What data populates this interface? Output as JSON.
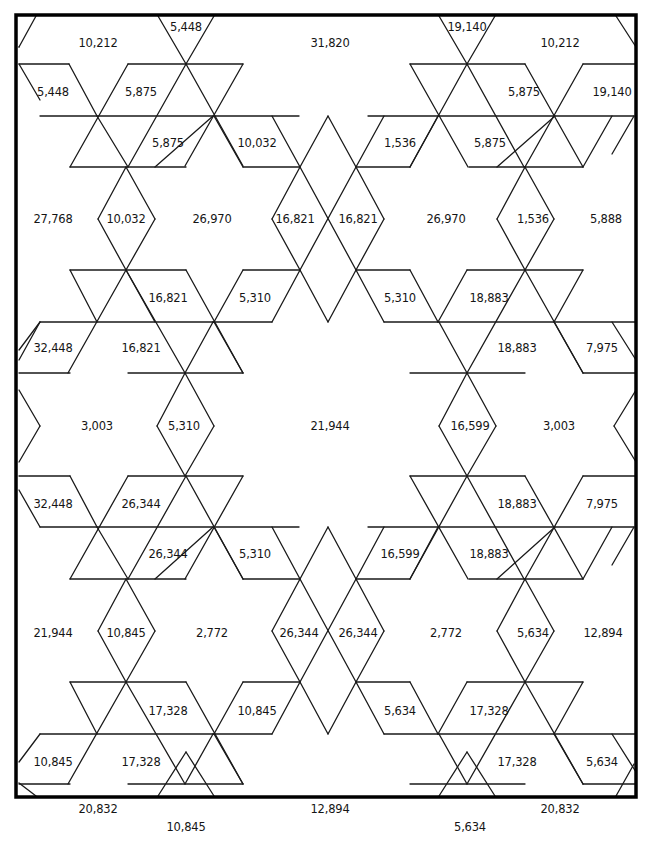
{
  "diagram": {
    "type": "triangular-lattice puzzle with numbered regions",
    "frame": {
      "x": 16,
      "y": 15,
      "w": 620,
      "h": 782,
      "stroke": "#000000",
      "width": 3.5
    },
    "line_color": "#1a1a1a",
    "labels": [
      {
        "text": "10,212",
        "x": 98,
        "y": 43
      },
      {
        "text": "5,448",
        "x": 186,
        "y": 27
      },
      {
        "text": "31,820",
        "x": 330,
        "y": 43
      },
      {
        "text": "19,140",
        "x": 467,
        "y": 27
      },
      {
        "text": "10,212",
        "x": 560,
        "y": 43
      },
      {
        "text": "5,448",
        "x": 53,
        "y": 92
      },
      {
        "text": "5,875",
        "x": 141,
        "y": 92
      },
      {
        "text": "5,875",
        "x": 524,
        "y": 92
      },
      {
        "text": "19,140",
        "x": 612,
        "y": 92
      },
      {
        "text": "5,875",
        "x": 168,
        "y": 143
      },
      {
        "text": "10,032",
        "x": 257,
        "y": 143
      },
      {
        "text": "1,536",
        "x": 400,
        "y": 143
      },
      {
        "text": "5,875",
        "x": 490,
        "y": 143
      },
      {
        "text": "27,768",
        "x": 53,
        "y": 219
      },
      {
        "text": "10,032",
        "x": 126,
        "y": 219
      },
      {
        "text": "26,970",
        "x": 212,
        "y": 219
      },
      {
        "text": "16,821",
        "x": 295,
        "y": 219
      },
      {
        "text": "16,821",
        "x": 358,
        "y": 219
      },
      {
        "text": "26,970",
        "x": 446,
        "y": 219
      },
      {
        "text": "1,536",
        "x": 533,
        "y": 219
      },
      {
        "text": "5,888",
        "x": 606,
        "y": 219
      },
      {
        "text": "16,821",
        "x": 168,
        "y": 298
      },
      {
        "text": "5,310",
        "x": 255,
        "y": 298
      },
      {
        "text": "5,310",
        "x": 400,
        "y": 298
      },
      {
        "text": "18,883",
        "x": 489,
        "y": 298
      },
      {
        "text": "32,448",
        "x": 53,
        "y": 348
      },
      {
        "text": "16,821",
        "x": 141,
        "y": 348
      },
      {
        "text": "18,883",
        "x": 517,
        "y": 348
      },
      {
        "text": "7,975",
        "x": 602,
        "y": 348
      },
      {
        "text": "3,003",
        "x": 97,
        "y": 426
      },
      {
        "text": "5,310",
        "x": 184,
        "y": 426
      },
      {
        "text": "21,944",
        "x": 330,
        "y": 426
      },
      {
        "text": "16,599",
        "x": 470,
        "y": 426
      },
      {
        "text": "3,003",
        "x": 559,
        "y": 426
      },
      {
        "text": "32,448",
        "x": 53,
        "y": 504
      },
      {
        "text": "26,344",
        "x": 141,
        "y": 504
      },
      {
        "text": "18,883",
        "x": 517,
        "y": 504
      },
      {
        "text": "7,975",
        "x": 602,
        "y": 504
      },
      {
        "text": "26,344",
        "x": 168,
        "y": 554
      },
      {
        "text": "5,310",
        "x": 255,
        "y": 554
      },
      {
        "text": "16,599",
        "x": 400,
        "y": 554
      },
      {
        "text": "18,883",
        "x": 489,
        "y": 554
      },
      {
        "text": "21,944",
        "x": 53,
        "y": 633
      },
      {
        "text": "10,845",
        "x": 126,
        "y": 633
      },
      {
        "text": "2,772",
        "x": 212,
        "y": 633
      },
      {
        "text": "26,344",
        "x": 299,
        "y": 633
      },
      {
        "text": "26,344",
        "x": 358,
        "y": 633
      },
      {
        "text": "2,772",
        "x": 446,
        "y": 633
      },
      {
        "text": "5,634",
        "x": 533,
        "y": 633
      },
      {
        "text": "12,894",
        "x": 603,
        "y": 633
      },
      {
        "text": "17,328",
        "x": 168,
        "y": 711
      },
      {
        "text": "10,845",
        "x": 257,
        "y": 711
      },
      {
        "text": "5,634",
        "x": 400,
        "y": 711
      },
      {
        "text": "17,328",
        "x": 489,
        "y": 711
      },
      {
        "text": "10,845",
        "x": 53,
        "y": 762
      },
      {
        "text": "17,328",
        "x": 141,
        "y": 762
      },
      {
        "text": "17,328",
        "x": 517,
        "y": 762
      },
      {
        "text": "5,634",
        "x": 602,
        "y": 762
      },
      {
        "text": "20,832",
        "x": 98,
        "y": 809
      },
      {
        "text": "10,845",
        "x": 186,
        "y": 827
      },
      {
        "text": "12,894",
        "x": 330,
        "y": 809
      },
      {
        "text": "5,634",
        "x": 470,
        "y": 827
      },
      {
        "text": "20,832",
        "x": 560,
        "y": 809
      }
    ]
  }
}
